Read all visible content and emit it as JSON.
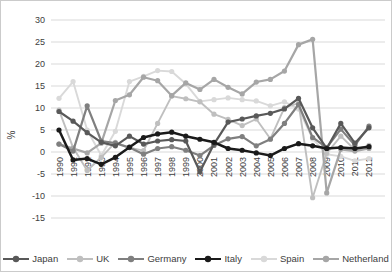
{
  "chart_data": {
    "type": "line",
    "title": "",
    "xlabel": "",
    "ylabel": "%",
    "ylim": [
      -15,
      30
    ],
    "ytick_step": 5,
    "grid": true,
    "legend_position": "bottom",
    "x": [
      1990,
      1991,
      1992,
      1993,
      1994,
      1995,
      1996,
      1997,
      1998,
      1999,
      2000,
      2001,
      2002,
      2003,
      2004,
      2005,
      2006,
      2007,
      2008,
      2009,
      2010,
      2011,
      2012
    ],
    "series": [
      {
        "name": "Japan",
        "color": "#595959",
        "line_width": 2.2,
        "values": [
          9.2,
          7.0,
          4.4,
          2.2,
          1.4,
          3.6,
          1.8,
          2.5,
          2.8,
          2.5,
          -4.5,
          1.8,
          6.8,
          7.5,
          8.2,
          8.8,
          9.8,
          12.2,
          5.5,
          0.8,
          6.5,
          2.0,
          5.5
        ]
      },
      {
        "name": "UK",
        "color": "#bfbfbf",
        "line_width": 1.9,
        "values": [
          9.5,
          1.0,
          -4.2,
          -1.2,
          2.2,
          1.0,
          0.3,
          6.5,
          12.7,
          12.1,
          11.4,
          8.6,
          7.4,
          6.0,
          7.5,
          3.0,
          10.1,
          11.1,
          -10.4,
          -0.3,
          3.6,
          0.5,
          1.5
        ]
      },
      {
        "name": "Germany",
        "color": "#7f7f7f",
        "line_width": 2.2,
        "values": [
          1.8,
          0.2,
          10.5,
          2.5,
          2.0,
          1.0,
          -0.5,
          0.8,
          1.2,
          0.4,
          -0.8,
          1.5,
          3.0,
          3.5,
          1.4,
          2.9,
          6.5,
          10.8,
          3.3,
          1.0,
          5.2,
          1.5,
          5.9
        ]
      },
      {
        "name": "Italy",
        "color": "#1a1a1a",
        "line_width": 2.5,
        "values": [
          5.0,
          -1.8,
          -1.5,
          -2.8,
          -1.2,
          1.1,
          3.3,
          4.1,
          4.5,
          3.6,
          2.9,
          2.2,
          0.8,
          0.4,
          -0.2,
          -0.8,
          0.8,
          1.9,
          1.4,
          0.8,
          1.0,
          0.8,
          1.2
        ]
      },
      {
        "name": "Spain",
        "color": "#d9d9d9",
        "line_width": 1.9,
        "values": [
          12.2,
          16.0,
          5.0,
          -0.8,
          4.7,
          16.0,
          17.2,
          18.5,
          18.3,
          15.5,
          11.5,
          11.9,
          12.3,
          11.9,
          11.6,
          10.5,
          11.4,
          9.8,
          3.0,
          -0.5,
          -1.0,
          -2.0,
          -1.5
        ]
      },
      {
        "name": "Netherland",
        "color": "#a6a6a6",
        "line_width": 2.2,
        "values": [
          1.8,
          0.8,
          -0.2,
          2.0,
          11.7,
          13.0,
          17.0,
          16.2,
          12.8,
          15.7,
          14.2,
          16.5,
          14.7,
          13.2,
          15.9,
          16.5,
          18.4,
          24.4,
          25.6,
          -9.3,
          0.6,
          0.2,
          0.8
        ]
      }
    ]
  },
  "axis": {
    "y_ticks": [
      "30",
      "25",
      "20",
      "15",
      "10",
      "5",
      "0",
      "-5",
      "-10",
      "-15"
    ],
    "y_title": "%"
  }
}
